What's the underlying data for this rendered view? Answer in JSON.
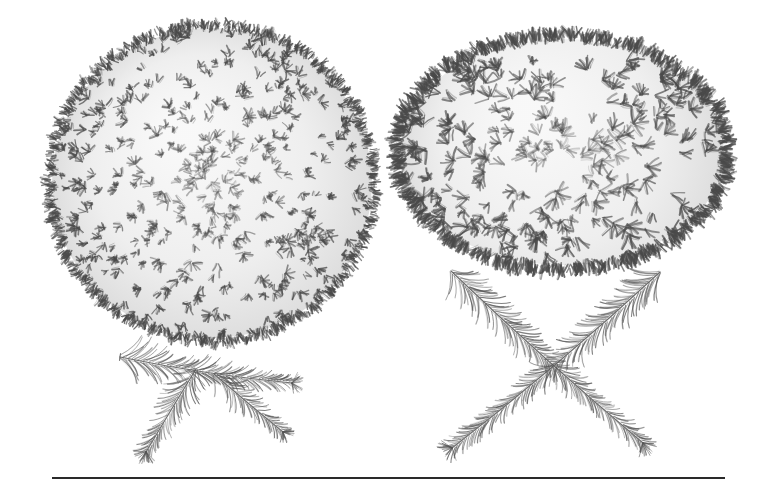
{
  "page": {
    "width": 777,
    "height": 493,
    "background_color": "#ffffff",
    "ink_color": "#3a3a3a",
    "ink_dark_color": "#2a2a2a",
    "medium": "pen-and-ink line drawing"
  },
  "figures": [
    {
      "id": "broom-left",
      "name": "left-broom-mass",
      "label": "",
      "shape": "globose",
      "center_x": 212,
      "center_y": 183,
      "radius_x": 160,
      "radius_y": 155,
      "stroke_length": 7,
      "stroke_width": 1.5,
      "density": 9000,
      "ink_color": "#4a4a4a"
    },
    {
      "id": "broom-right",
      "name": "right-broom-mass",
      "label": "",
      "shape": "depressed-globose",
      "center_x": 562,
      "center_y": 152,
      "radius_x": 162,
      "radius_y": 113,
      "stroke_length": 11,
      "stroke_width": 1.8,
      "density": 5200,
      "ink_color": "#4a4a4a"
    }
  ],
  "branches": [
    {
      "id": "branch-left",
      "name": "left-branchlet-specimen",
      "label": "",
      "arrangement": "forked",
      "ink_color": "#555555",
      "axes": [
        {
          "x1": 120,
          "y1": 357,
          "x2": 292,
          "y2": 383,
          "needle_len": 26,
          "taper": 0.55,
          "cut_end": true
        },
        {
          "x1": 196,
          "y1": 369,
          "x2": 146,
          "y2": 452,
          "needle_len": 25,
          "taper": 0.5,
          "cut_end": false
        },
        {
          "x1": 214,
          "y1": 374,
          "x2": 283,
          "y2": 432,
          "needle_len": 22,
          "taper": 0.5,
          "cut_end": false
        }
      ]
    },
    {
      "id": "branch-right",
      "name": "right-branchlet-specimen",
      "label": "",
      "arrangement": "crossed-X",
      "ink_color": "#555555",
      "axes": [
        {
          "x1": 451,
          "y1": 271,
          "x2": 643,
          "y2": 443,
          "needle_len": 25,
          "taper": 0.45,
          "cut_end": false
        },
        {
          "x1": 660,
          "y1": 272,
          "x2": 452,
          "y2": 448,
          "needle_len": 25,
          "taper": 0.45,
          "cut_end": false
        }
      ]
    }
  ],
  "baseline": {
    "name": "baseline-rule",
    "x": 52,
    "y": 477,
    "width": 673,
    "height": 2,
    "color": "#2a2a2a"
  },
  "a11y": {
    "alt": "Pen-and-ink botanical plate showing two dense rounded conifer witches'-broom masses; below the left mass a forked needle-covered branchlet, below the right mass two needle-covered branchlets crossed in an X; a ruled line spans the lower margin."
  }
}
